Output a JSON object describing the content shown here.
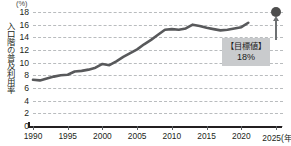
{
  "chart_data": {
    "type": "line",
    "title": "",
    "xlabel": "(年度)",
    "ylabel": "入口階の普及利用率",
    "unit_label": "(%)",
    "grid": true,
    "legend": "none",
    "xlim": [
      1990,
      2026
    ],
    "ylim": [
      0,
      18
    ],
    "ytick_labels": [
      "18",
      "16",
      "14",
      "12",
      "10",
      "8",
      "6",
      "4",
      "2",
      "0"
    ],
    "ytick_values": [
      18,
      16,
      14,
      12,
      10,
      8,
      6,
      4,
      2,
      0
    ],
    "xtick_labels": [
      "1990",
      "1995",
      "2000",
      "2005",
      "2010",
      "2015",
      "2020",
      "2025"
    ],
    "xtick_values": [
      1990,
      1995,
      2000,
      2005,
      2010,
      2015,
      2020,
      2025
    ],
    "xtick_last_suffix": "2025(年度)",
    "series": [
      {
        "name": "利用率",
        "color": "#58595b",
        "x": [
          1990,
          1991,
          1992,
          1993,
          1994,
          1995,
          1996,
          1997,
          1998,
          1999,
          2000,
          2001,
          2002,
          2003,
          2004,
          2005,
          2006,
          2007,
          2008,
          2009,
          2010,
          2011,
          2012,
          2013,
          2014,
          2015,
          2016,
          2017,
          2018,
          2019,
          2020,
          2021
        ],
        "values": [
          7.3,
          7.2,
          7.5,
          7.8,
          8.0,
          8.1,
          8.6,
          8.7,
          8.9,
          9.2,
          9.8,
          9.6,
          10.2,
          10.9,
          11.5,
          12.1,
          12.9,
          13.6,
          14.4,
          15.2,
          15.3,
          15.2,
          15.4,
          16.0,
          15.8,
          15.5,
          15.3,
          15.1,
          15.2,
          15.4,
          15.6,
          16.3
        ]
      }
    ],
    "annotations": [
      {
        "name": "target",
        "label_line1": "【目標値】",
        "label_line2": "18%",
        "x": 2025,
        "y": 18,
        "marker": "filled-circle",
        "marker_color": "#4d4d4d",
        "box_color": "#c9cbcd"
      }
    ]
  }
}
